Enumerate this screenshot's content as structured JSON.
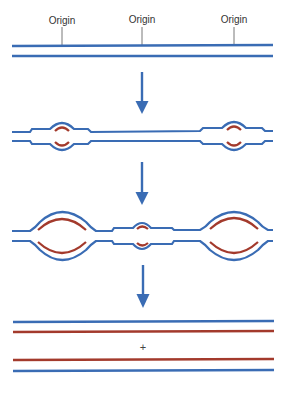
{
  "diagram": {
    "title": "",
    "colors": {
      "parental_strand": "#3a6cb4",
      "new_strand": "#a33a2c",
      "arrow": "#3a6cb4",
      "label_tick": "#555555"
    },
    "stage1": {
      "label": "Unreplicated DNA with multiple origins",
      "origins": [
        {
          "label": "Origin",
          "x": 62
        },
        {
          "label": "Origin",
          "x": 142
        },
        {
          "label": "Origin",
          "x": 234
        }
      ]
    },
    "stage2": {
      "label": "Replication bubbles form at two origins"
    },
    "stage3": {
      "label": "Bubbles enlarge; third origin fires"
    },
    "stage4": {
      "label": "Two daughter DNA molecules",
      "separator": "+"
    }
  }
}
